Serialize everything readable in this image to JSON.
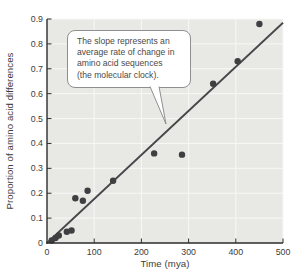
{
  "colors": {
    "page_bg": "#ffffff",
    "plot_bg": "#e8e8e5",
    "grid": "#f8f8f6",
    "point": "#3f3f41",
    "trend_line": "#47474a",
    "axis": "#2d2d2d",
    "tick_text": "#3c3c3c",
    "callout_border": "#8f8f8f",
    "callout_bg": "#ffffff",
    "callout_text": "#4a4a4a"
  },
  "chart_data": {
    "type": "scatter",
    "title": "",
    "xlabel": "Time (mya)",
    "ylabel": "Proportion of amino acid differences",
    "xlim": [
      0,
      500
    ],
    "ylim": [
      0,
      0.9
    ],
    "x_ticks": [
      0,
      100,
      200,
      300,
      400,
      500
    ],
    "x_tick_labels": [
      "0",
      "100",
      "200",
      "300",
      "400",
      "500"
    ],
    "y_ticks": [
      0,
      0.1,
      0.2,
      0.3,
      0.4,
      0.5,
      0.6,
      0.7,
      0.8,
      0.9
    ],
    "y_tick_labels": [
      "0",
      "0.1",
      "0.2",
      "0.3",
      "0.4",
      "0.5",
      "0.6",
      "0.7",
      "0.8",
      "0.9"
    ],
    "grid": true,
    "points": [
      [
        10,
        0.01
      ],
      [
        18,
        0.02
      ],
      [
        25,
        0.03
      ],
      [
        42,
        0.045
      ],
      [
        52,
        0.05
      ],
      [
        60,
        0.18
      ],
      [
        76,
        0.17
      ],
      [
        86,
        0.21
      ],
      [
        140,
        0.25
      ],
      [
        227,
        0.36
      ],
      [
        286,
        0.355
      ],
      [
        352,
        0.64
      ],
      [
        404,
        0.73
      ],
      [
        450,
        0.88
      ]
    ],
    "trend_line": {
      "x": [
        0,
        500
      ],
      "y": [
        0,
        0.885
      ]
    },
    "annotation": {
      "text": "The slope represents an average rate of change in amino acid sequences (the molecular clock).",
      "lines": [
        "The slope represents an",
        "average rate of change in",
        "amino acid sequences",
        "(the molecular clock)."
      ]
    }
  }
}
